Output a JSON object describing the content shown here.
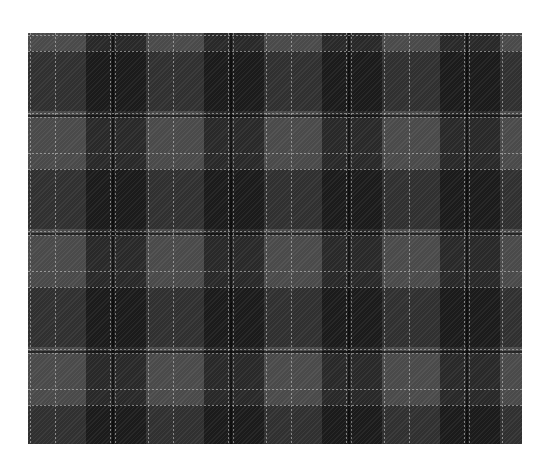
{
  "image": {
    "subject": "grey tartan plaid fabric swatch",
    "colors": {
      "base": "#4a4a4a",
      "dark_band": "#1a1a1a",
      "light_line": "#d2d2d2",
      "background": "#ffffff"
    },
    "pattern": {
      "repeat_px": 118,
      "texture": "diagonal twill"
    }
  }
}
